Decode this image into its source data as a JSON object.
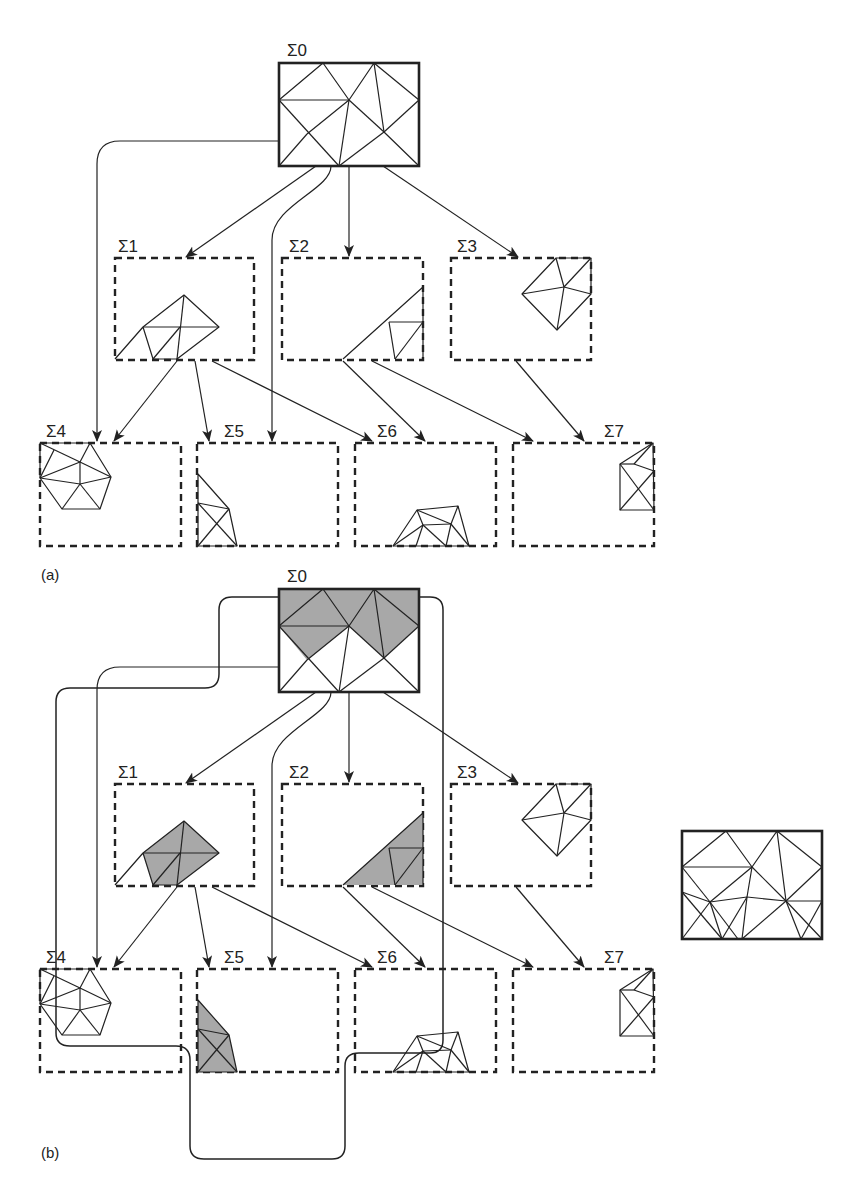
{
  "figure": {
    "panels": [
      {
        "id": "a",
        "caption": "(a)",
        "nodes": [
          {
            "id": "S0",
            "label": "Σ0",
            "style": "solid",
            "shaded": false
          },
          {
            "id": "S1",
            "label": "Σ1",
            "style": "dashed",
            "shaded": false
          },
          {
            "id": "S2",
            "label": "Σ2",
            "style": "dashed",
            "shaded": false
          },
          {
            "id": "S3",
            "label": "Σ3",
            "style": "dashed",
            "shaded": false
          },
          {
            "id": "S4",
            "label": "Σ4",
            "style": "dashed",
            "shaded": false
          },
          {
            "id": "S5",
            "label": "Σ5",
            "style": "dashed",
            "shaded": false
          },
          {
            "id": "S6",
            "label": "Σ6",
            "style": "dashed",
            "shaded": false
          },
          {
            "id": "S7",
            "label": "Σ7",
            "style": "dashed",
            "shaded": false
          }
        ]
      },
      {
        "id": "b",
        "caption": "(b)",
        "nodes": [
          {
            "id": "S0",
            "label": "Σ0",
            "style": "solid",
            "shaded": true
          },
          {
            "id": "S1",
            "label": "Σ1",
            "style": "dashed",
            "shaded": true
          },
          {
            "id": "S2",
            "label": "Σ2",
            "style": "dashed",
            "shaded": true
          },
          {
            "id": "S3",
            "label": "Σ3",
            "style": "dashed",
            "shaded": false
          },
          {
            "id": "S4",
            "label": "Σ4",
            "style": "dashed",
            "shaded": false
          },
          {
            "id": "S5",
            "label": "Σ5",
            "style": "dashed",
            "shaded": true
          },
          {
            "id": "S6",
            "label": "Σ6",
            "style": "dashed",
            "shaded": false
          },
          {
            "id": "S7",
            "label": "Σ7",
            "style": "dashed",
            "shaded": false
          }
        ],
        "highlighted_region": [
          "S0",
          "S1",
          "S2",
          "S5"
        ],
        "result_mesh": "combined triangulation (right side)"
      }
    ],
    "edges": [
      {
        "from": "S0",
        "to": "S1"
      },
      {
        "from": "S0",
        "to": "S2"
      },
      {
        "from": "S0",
        "to": "S3"
      },
      {
        "from": "S0",
        "to": "S4"
      },
      {
        "from": "S0",
        "to": "S5"
      },
      {
        "from": "S1",
        "to": "S4"
      },
      {
        "from": "S1",
        "to": "S5"
      },
      {
        "from": "S1",
        "to": "S6"
      },
      {
        "from": "S2",
        "to": "S6"
      },
      {
        "from": "S2",
        "to": "S7"
      },
      {
        "from": "S3",
        "to": "S7"
      }
    ],
    "colors": {
      "line": "#222222",
      "shade": "#a8a8a8",
      "background": "#ffffff"
    }
  }
}
